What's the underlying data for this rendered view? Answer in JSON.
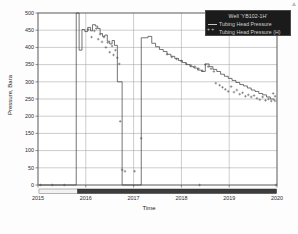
{
  "chart_data": {
    "type": "line",
    "title": "",
    "xlabel": "Time",
    "ylabel": "Pressure, Bara",
    "xlim": [
      2015.0,
      2020.0
    ],
    "ylim": [
      0,
      500
    ],
    "grid": true,
    "legend_position": "top-right",
    "xticks": [
      "2015",
      "2016",
      "2017",
      "2018",
      "2019",
      "2020"
    ],
    "yticks": [
      "0",
      "50",
      "100",
      "150",
      "200",
      "250",
      "300",
      "350",
      "400",
      "450",
      "500"
    ],
    "legend": {
      "title": "Well 'YB102-1H'",
      "entries": [
        {
          "label": "Tubing Head Pressure",
          "marker": "line",
          "color": "#3a3a3a"
        },
        {
          "label": "Tubing Head Pressure (H)",
          "marker": "plus",
          "color": "#555555"
        }
      ]
    },
    "series": [
      {
        "name": "Tubing Head Pressure",
        "marker": "step-line",
        "color": "#3a3a3a",
        "points": [
          [
            2015.02,
            0
          ],
          [
            2015.8,
            0
          ],
          [
            2015.8,
            500
          ],
          [
            2015.86,
            500
          ],
          [
            2015.86,
            392
          ],
          [
            2015.92,
            392
          ],
          [
            2015.92,
            452
          ],
          [
            2015.98,
            452
          ],
          [
            2015.98,
            446
          ],
          [
            2016.04,
            446
          ],
          [
            2016.04,
            458
          ],
          [
            2016.1,
            458
          ],
          [
            2016.1,
            448
          ],
          [
            2016.14,
            448
          ],
          [
            2016.14,
            466
          ],
          [
            2016.2,
            466
          ],
          [
            2016.2,
            462
          ],
          [
            2016.25,
            462
          ],
          [
            2016.25,
            455
          ],
          [
            2016.3,
            455
          ],
          [
            2016.3,
            440
          ],
          [
            2016.35,
            440
          ],
          [
            2016.35,
            432
          ],
          [
            2016.4,
            432
          ],
          [
            2016.4,
            436
          ],
          [
            2016.45,
            436
          ],
          [
            2016.45,
            418
          ],
          [
            2016.5,
            418
          ],
          [
            2016.5,
            410
          ],
          [
            2016.55,
            410
          ],
          [
            2016.55,
            420
          ],
          [
            2016.6,
            420
          ],
          [
            2016.6,
            406
          ],
          [
            2016.66,
            406
          ],
          [
            2016.66,
            300
          ],
          [
            2016.76,
            300
          ],
          [
            2016.76,
            0
          ],
          [
            2017.16,
            0
          ],
          [
            2017.16,
            428
          ],
          [
            2017.3,
            428
          ],
          [
            2017.3,
            432
          ],
          [
            2017.38,
            432
          ],
          [
            2017.38,
            412
          ],
          [
            2017.46,
            412
          ],
          [
            2017.46,
            402
          ],
          [
            2017.54,
            402
          ],
          [
            2017.54,
            394
          ],
          [
            2017.62,
            394
          ],
          [
            2017.62,
            388
          ],
          [
            2017.7,
            388
          ],
          [
            2017.7,
            380
          ],
          [
            2017.78,
            380
          ],
          [
            2017.78,
            374
          ],
          [
            2017.86,
            374
          ],
          [
            2017.86,
            368
          ],
          [
            2017.94,
            368
          ],
          [
            2017.94,
            362
          ],
          [
            2018.02,
            362
          ],
          [
            2018.02,
            356
          ],
          [
            2018.1,
            356
          ],
          [
            2018.1,
            350
          ],
          [
            2018.18,
            350
          ],
          [
            2018.18,
            344
          ],
          [
            2018.26,
            344
          ],
          [
            2018.26,
            340
          ],
          [
            2018.34,
            340
          ],
          [
            2018.34,
            334
          ],
          [
            2018.42,
            334
          ],
          [
            2018.42,
            330
          ],
          [
            2018.5,
            330
          ],
          [
            2018.5,
            352
          ],
          [
            2018.58,
            352
          ],
          [
            2018.58,
            344
          ],
          [
            2018.66,
            344
          ],
          [
            2018.66,
            336
          ],
          [
            2018.74,
            336
          ],
          [
            2018.74,
            330
          ],
          [
            2018.82,
            330
          ],
          [
            2018.82,
            322
          ],
          [
            2018.9,
            322
          ],
          [
            2018.9,
            316
          ],
          [
            2018.98,
            316
          ],
          [
            2018.98,
            310
          ],
          [
            2019.06,
            310
          ],
          [
            2019.06,
            304
          ],
          [
            2019.14,
            304
          ],
          [
            2019.14,
            298
          ],
          [
            2019.22,
            298
          ],
          [
            2019.22,
            292
          ],
          [
            2019.3,
            292
          ],
          [
            2019.3,
            288
          ],
          [
            2019.38,
            288
          ],
          [
            2019.38,
            282
          ],
          [
            2019.46,
            282
          ],
          [
            2019.46,
            276
          ],
          [
            2019.54,
            276
          ],
          [
            2019.54,
            272
          ],
          [
            2019.62,
            272
          ],
          [
            2019.62,
            266
          ],
          [
            2019.7,
            266
          ],
          [
            2019.7,
            262
          ],
          [
            2019.78,
            262
          ],
          [
            2019.78,
            256
          ],
          [
            2019.86,
            256
          ],
          [
            2019.86,
            250
          ],
          [
            2019.94,
            250
          ],
          [
            2019.94,
            244
          ],
          [
            2019.99,
            244
          ]
        ]
      },
      {
        "name": "Tubing Head Pressure (H)",
        "marker": "plus",
        "color": "#555555",
        "points": [
          [
            2015.05,
            0
          ],
          [
            2015.3,
            0
          ],
          [
            2015.55,
            0
          ],
          [
            2016.05,
            452
          ],
          [
            2016.12,
            430
          ],
          [
            2016.18,
            448
          ],
          [
            2016.22,
            455
          ],
          [
            2016.26,
            424
          ],
          [
            2016.3,
            438
          ],
          [
            2016.34,
            416
          ],
          [
            2016.38,
            430
          ],
          [
            2016.42,
            400
          ],
          [
            2016.46,
            414
          ],
          [
            2016.5,
            386
          ],
          [
            2016.55,
            404
          ],
          [
            2016.58,
            378
          ],
          [
            2016.62,
            392
          ],
          [
            2016.66,
            370
          ],
          [
            2016.7,
            352
          ],
          [
            2016.72,
            185
          ],
          [
            2016.76,
            44
          ],
          [
            2016.82,
            40
          ],
          [
            2017.02,
            40
          ],
          [
            2017.16,
            136
          ],
          [
            2017.7,
            380
          ],
          [
            2017.8,
            372
          ],
          [
            2017.9,
            366
          ],
          [
            2018.0,
            360
          ],
          [
            2018.1,
            352
          ],
          [
            2018.2,
            348
          ],
          [
            2018.28,
            344
          ],
          [
            2018.36,
            338
          ],
          [
            2018.44,
            332
          ],
          [
            2018.5,
            350
          ],
          [
            2018.56,
            344
          ],
          [
            2018.62,
            338
          ],
          [
            2018.68,
            330
          ],
          [
            2018.72,
            296
          ],
          [
            2018.8,
            290
          ],
          [
            2018.86,
            284
          ],
          [
            2018.92,
            278
          ],
          [
            2018.98,
            272
          ],
          [
            2019.04,
            286
          ],
          [
            2019.1,
            270
          ],
          [
            2019.16,
            276
          ],
          [
            2019.22,
            264
          ],
          [
            2019.28,
            268
          ],
          [
            2019.34,
            258
          ],
          [
            2019.4,
            262
          ],
          [
            2019.46,
            256
          ],
          [
            2019.52,
            260
          ],
          [
            2019.58,
            252
          ],
          [
            2019.64,
            248
          ],
          [
            2019.7,
            256
          ],
          [
            2019.76,
            246
          ],
          [
            2019.82,
            250
          ],
          [
            2019.88,
            244
          ],
          [
            2019.92,
            266
          ],
          [
            2019.96,
            258
          ],
          [
            2018.38,
            0
          ],
          [
            2019.98,
            0
          ]
        ]
      }
    ],
    "bottom_bands": [
      {
        "start": 2015.02,
        "end": 2015.83,
        "color": "#f2f2f2",
        "border": "#707070"
      },
      {
        "start": 2015.83,
        "end": 2019.99,
        "color": "#3c3c3c",
        "border": "#2a2a2a"
      }
    ]
  }
}
